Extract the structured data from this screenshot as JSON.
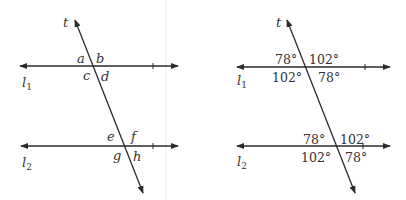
{
  "figures": [
    {
      "name": "letters",
      "transversal_label": "t",
      "line1": {
        "label": "l",
        "subscript": "1"
      },
      "line2": {
        "label": "l",
        "subscript": "2"
      },
      "top_angles": [
        "a",
        "b",
        "c",
        "d"
      ],
      "bottom_angles": [
        "e",
        "f",
        "g",
        "h"
      ]
    },
    {
      "name": "degrees",
      "transversal_label": "t",
      "line1": {
        "label": "l",
        "subscript": "1"
      },
      "line2": {
        "label": "l",
        "subscript": "2"
      },
      "top_angles": [
        "78°",
        "102°",
        "102°",
        "78°"
      ],
      "bottom_angles": [
        "78°",
        "102°",
        "102°",
        "78°"
      ]
    }
  ],
  "colors": {
    "line": "#2a2a2a",
    "text": "#333333",
    "divider": "#eeeeee"
  }
}
